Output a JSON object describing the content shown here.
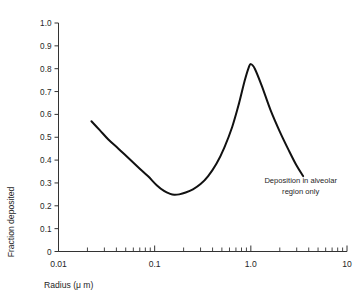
{
  "chart_data": {
    "type": "line",
    "title": "",
    "subtitle": "",
    "xlabel": "Radius (μ m)",
    "ylabel": "Fraction deposited",
    "xscale": "log",
    "yscale": "linear",
    "xlim": [
      0.01,
      10
    ],
    "ylim": [
      0,
      1.0
    ],
    "grid": false,
    "legend": "none",
    "xtick_labels": [
      "0.01",
      "0.1",
      "1.0",
      "10"
    ],
    "xtick_values": [
      0.01,
      0.1,
      1.0,
      10
    ],
    "ytick_labels": [
      "0",
      "0.1",
      "0.2",
      "0.3",
      "0.4",
      "0.5",
      "0.6",
      "0.7",
      "0.8",
      "0.9",
      "1.0"
    ],
    "ytick_values": [
      0,
      0.1,
      0.2,
      0.3,
      0.4,
      0.5,
      0.6,
      0.7,
      0.8,
      0.9,
      1.0
    ],
    "annotations": [
      {
        "text_line_1": "Deposition in alveolar",
        "text_line_2": "region only",
        "x": 3.3,
        "y": 0.3
      }
    ],
    "series": [
      {
        "name": "Fraction deposited",
        "color": "#111111",
        "x": [
          0.022,
          0.027,
          0.033,
          0.042,
          0.053,
          0.067,
          0.085,
          0.105,
          0.125,
          0.145,
          0.16,
          0.18,
          0.21,
          0.25,
          0.3,
          0.36,
          0.44,
          0.53,
          0.64,
          0.75,
          0.86,
          0.95,
          1.0,
          1.1,
          1.3,
          1.6,
          2.0,
          2.5,
          3.0,
          3.5
        ],
        "y": [
          0.57,
          0.53,
          0.49,
          0.45,
          0.41,
          0.37,
          0.33,
          0.29,
          0.265,
          0.252,
          0.248,
          0.25,
          0.258,
          0.272,
          0.295,
          0.33,
          0.385,
          0.455,
          0.545,
          0.645,
          0.745,
          0.805,
          0.82,
          0.8,
          0.725,
          0.62,
          0.525,
          0.44,
          0.375,
          0.33
        ]
      }
    ],
    "key_points": {
      "start": {
        "x": 0.022,
        "y": 0.57
      },
      "minimum": {
        "x": 0.16,
        "y": 0.25
      },
      "peak": {
        "x": 1.0,
        "y": 0.82
      },
      "end": {
        "x": 3.5,
        "y": 0.33
      }
    }
  }
}
